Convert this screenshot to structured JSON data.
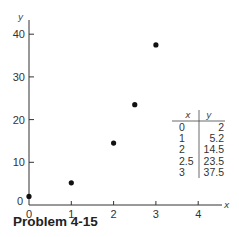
{
  "caption": "Problem 4-15",
  "chart_data": {
    "type": "scatter",
    "title": "",
    "xlabel": "x",
    "ylabel": "y",
    "xlim": [
      0,
      4
    ],
    "ylim": [
      0,
      40
    ],
    "x_ticks": [
      "0",
      "1",
      "2",
      "3",
      "4"
    ],
    "y_ticks": [
      "0",
      "10",
      "20",
      "30",
      "40"
    ],
    "grid": false,
    "series": [
      {
        "name": "data",
        "x": [
          0,
          1,
          2,
          2.5,
          3
        ],
        "y": [
          2,
          5.2,
          14.5,
          23.5,
          37.5
        ]
      }
    ],
    "inset_table": {
      "headers": [
        "x",
        "y"
      ],
      "rows": [
        [
          "0",
          "2"
        ],
        [
          "1",
          "5.2"
        ],
        [
          "2",
          "14.5"
        ],
        [
          "2.5",
          "23.5"
        ],
        [
          "3",
          "37.5"
        ]
      ]
    }
  }
}
